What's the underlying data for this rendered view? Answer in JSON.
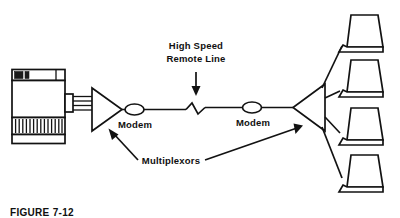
{
  "figure": {
    "caption": "FIGURE 7-12",
    "background_color": "#ffffff",
    "ink_color": "#121212",
    "width": 400,
    "height": 218
  },
  "labels": {
    "high_speed_line_1": "High Speed",
    "high_speed_line_2": "Remote Line",
    "modem_left": "Modem",
    "modem_right": "Modem",
    "multiplexors": "Multiplexors"
  },
  "nodes": {
    "mainframe": {
      "name": "Mainframe Computer",
      "panels": [
        "tape-drive-panel",
        "blank-panel",
        "vent-grill-panel",
        "base-plinth"
      ],
      "tape_drive_count": 2,
      "vent_slat_count": 13,
      "bus_line_count": 4
    },
    "multiplexor_left": {
      "name": "Multiplexor",
      "shape": "triangle",
      "direction": "right"
    },
    "multiplexor_right": {
      "name": "Multiplexor",
      "shape": "triangle",
      "direction": "left"
    },
    "modem_left": {
      "name": "Modem",
      "shape": "ellipse"
    },
    "modem_right": {
      "name": "Modem",
      "shape": "ellipse"
    },
    "remote_line": {
      "name": "High Speed Remote Line",
      "break_symbol": "z-break"
    },
    "terminals": [
      {
        "id": "terminal-1",
        "name": "Terminal"
      },
      {
        "id": "terminal-2",
        "name": "Terminal"
      },
      {
        "id": "terminal-3",
        "name": "Terminal"
      },
      {
        "id": "terminal-4",
        "name": "Terminal"
      }
    ]
  }
}
